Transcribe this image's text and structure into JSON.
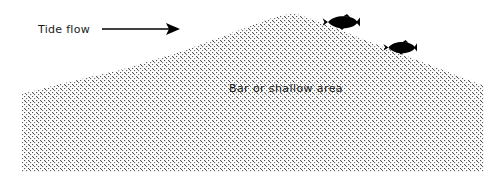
{
  "diagram": {
    "background_color": "#ffffff",
    "annotations": {
      "tide_flow_label": "Tide flow",
      "bar_label": "Bar or shallow area"
    },
    "arrow": {
      "name": "tide-flow-arrow",
      "direction": "right",
      "color": "#000000",
      "x_start": 102,
      "x_end": 180,
      "y": 29
    },
    "landform": {
      "name": "sandbar-cross-section",
      "fill_pattern": "stipple-dots",
      "dot_color": "#3a3a3a",
      "outline": "none",
      "peak": {
        "x": 294,
        "y": 13
      },
      "points": "22,94 60,84 120,70 180,52 240,30 272,18 294,13 320,22 360,38 404,55 448,72 484,86 484,172 22,172"
    },
    "fish": [
      {
        "name": "fish-upper",
        "x": 322,
        "y": 14,
        "width": 38,
        "height": 16,
        "facing": "left",
        "color": "#000000"
      },
      {
        "name": "fish-lower",
        "x": 383,
        "y": 40,
        "width": 34,
        "height": 15,
        "facing": "left",
        "color": "#000000"
      }
    ],
    "text_positions": {
      "tide_flow": {
        "x": 38,
        "y": 33
      },
      "bar_label": {
        "x": 229,
        "y": 92
      }
    }
  }
}
